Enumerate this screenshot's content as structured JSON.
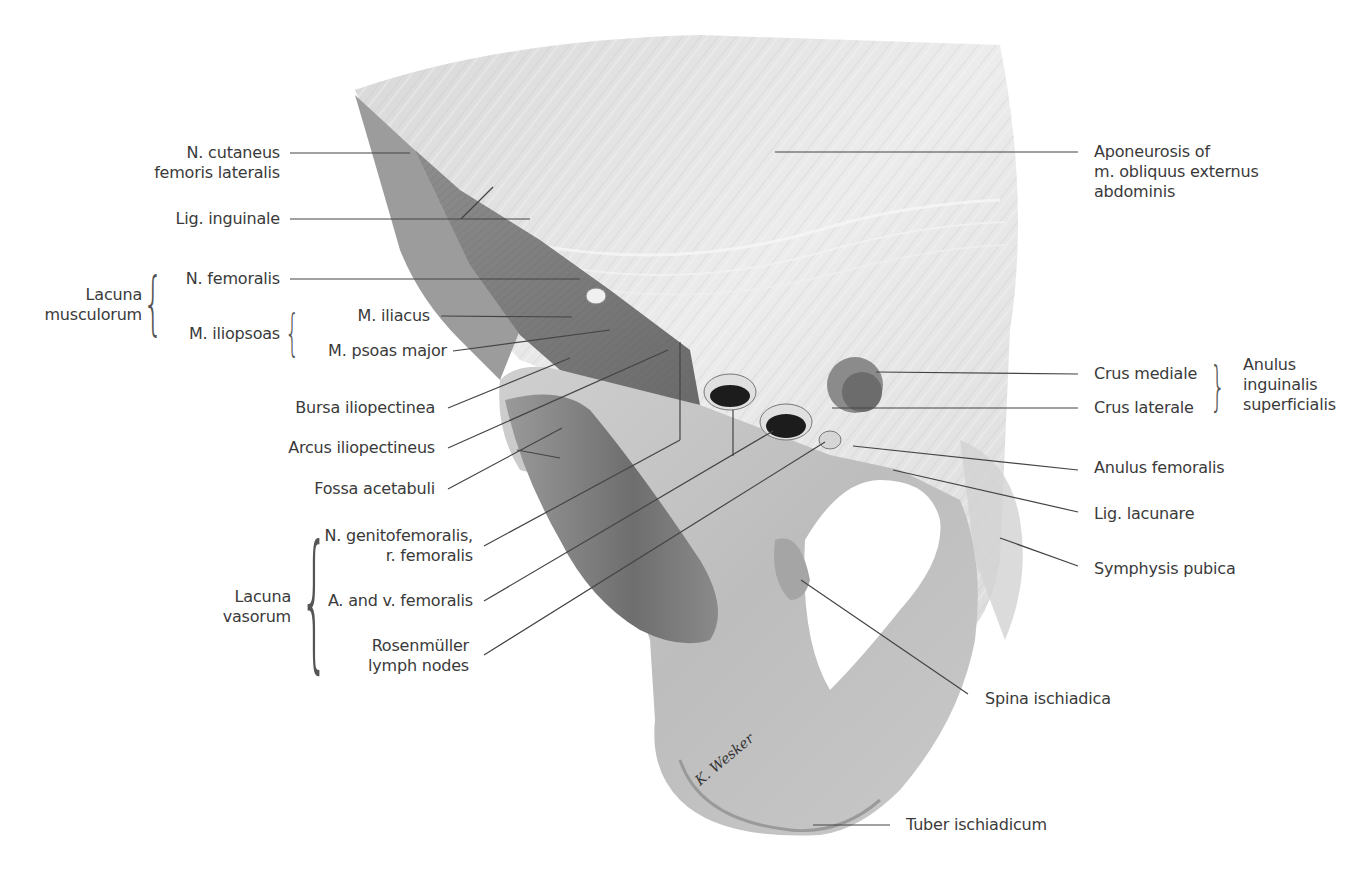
{
  "figure": {
    "colors": {
      "label_text": "#3a3a3a",
      "leader_line": "#444444",
      "bone": "#c9c9c9",
      "fascia": "#e4e4e4",
      "background": "#ffffff"
    }
  },
  "labels_left": {
    "n_cutaneus": {
      "line1": "N. cutaneus",
      "line2": "femoris lateralis"
    },
    "lig_inguinale": "Lig. inguinale",
    "lacuna_musculorum": {
      "group_line1": "Lacuna",
      "group_line2": "musculorum",
      "n_femoralis": "N. femoralis",
      "m_iliopsoas": {
        "label": "M. iliopsoas",
        "m_iliacus": "M. iliacus",
        "m_psoas_major": "M. psoas major"
      }
    },
    "bursa_iliopectinea": "Bursa iliopectinea",
    "arcus_iliopectineus": "Arcus iliopectineus",
    "fossa_acetabuli": "Fossa acetabuli",
    "lacuna_vasorum": {
      "group_line1": "Lacuna",
      "group_line2": "vasorum",
      "n_genitofemoralis": {
        "line1": "N. genitofemoralis,",
        "line2": "r. femoralis"
      },
      "a_v_femoralis": "A. and v. femoralis",
      "rosenmuller": {
        "line1": "Rosenmüller",
        "line2": "lymph nodes"
      }
    }
  },
  "labels_right": {
    "aponeurosis": {
      "line1": "Aponeurosis of",
      "line2": "m. obliquus externus",
      "line3": "abdominis"
    },
    "anulus_inguinalis": {
      "crus_mediale": "Crus mediale",
      "crus_laterale": "Crus laterale",
      "group_line1": "Anulus",
      "group_line2": "inguinalis",
      "group_line3": "superficialis"
    },
    "anulus_femoralis": "Anulus femoralis",
    "lig_lacunare": "Lig. lacunare",
    "symphysis_pubica": "Symphysis pubica",
    "spina_ischiadica": "Spina ischiadica",
    "tuber_ischiadicum": "Tuber ischiadicum"
  },
  "signature": "K. Wesker"
}
